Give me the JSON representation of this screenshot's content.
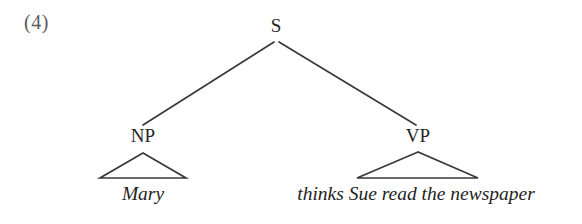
{
  "figure": {
    "example_number": "(4)",
    "kind": "phrase-structure-tree",
    "ink_color": "#3a3a3a",
    "background_color": "#ffffff",
    "text_color": "#262626"
  },
  "tree": {
    "root": {
      "label": "S",
      "x": 276,
      "y": 26
    },
    "nodes": [
      {
        "id": "np",
        "label": "NP",
        "x": 143,
        "y": 137,
        "terminal": "Mary",
        "terminal_x": 143,
        "terminal_y": 198,
        "triangle": {
          "apex_x": 143,
          "apex_y": 153,
          "left_x": 100,
          "right_x": 186,
          "base_y": 178
        }
      },
      {
        "id": "vp",
        "label": "VP",
        "x": 418,
        "y": 137,
        "terminal": "thinks Sue read the newspaper",
        "terminal_x": 416,
        "terminal_y": 198,
        "triangle": {
          "apex_x": 418,
          "apex_y": 152,
          "left_x": 357,
          "right_x": 478,
          "base_y": 178
        }
      }
    ],
    "branches": [
      {
        "from": "s",
        "to": "np",
        "x1": 274,
        "y1": 42,
        "x2": 143,
        "y2": 125
      },
      {
        "from": "s",
        "to": "vp",
        "x1": 279,
        "y1": 42,
        "x2": 416,
        "y2": 125
      }
    ]
  }
}
